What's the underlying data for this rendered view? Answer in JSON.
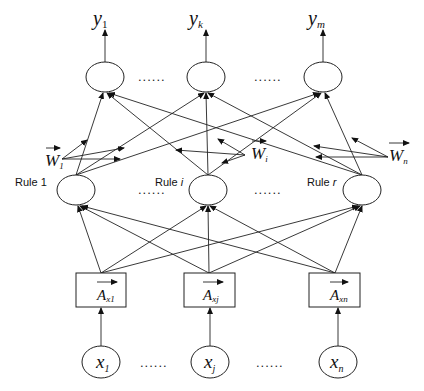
{
  "diagram": {
    "type": "neuro-fuzzy network",
    "outputs": [
      {
        "label": "y",
        "sub": "1"
      },
      {
        "label": "y",
        "sub": "k"
      },
      {
        "label": "y",
        "sub": "m"
      }
    ],
    "rules": [
      {
        "label": "Rule 1",
        "name": "Rule ",
        "idx": "1"
      },
      {
        "label": "Rule i",
        "name": "Rule ",
        "idx": "i"
      },
      {
        "label": "Rule r",
        "name": "Rule ",
        "idx": "r"
      }
    ],
    "weights": [
      {
        "label": "W",
        "sub": "1"
      },
      {
        "label": "W",
        "sub": "i"
      },
      {
        "label": "W",
        "sub": "n"
      }
    ],
    "antecedents": [
      {
        "label": "A",
        "sub": "x1"
      },
      {
        "label": "A",
        "sub": "xj"
      },
      {
        "label": "A",
        "sub": "xn"
      }
    ],
    "inputs": [
      {
        "label": "x",
        "sub": "1"
      },
      {
        "label": "x",
        "sub": "j"
      },
      {
        "label": "x",
        "sub": "n"
      }
    ],
    "ellipsis": "......"
  }
}
